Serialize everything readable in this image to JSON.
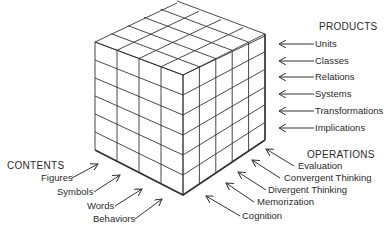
{
  "diagram": {
    "colors": {
      "line": "#333333",
      "text": "#2a2a2a",
      "background": "#ffffff"
    },
    "cube": {
      "front_face_columns": 4,
      "right_face_columns": 5,
      "rows": 6
    },
    "products": {
      "heading": "PRODUCTS",
      "items": [
        "Units",
        "Classes",
        "Relations",
        "Systems",
        "Transformations",
        "Implications"
      ]
    },
    "operations": {
      "heading": "OPERATIONS",
      "items": [
        "Evaluation",
        "Convergent Thinking",
        "Divergent Thinking",
        "Memorization",
        "Cognition"
      ]
    },
    "contents": {
      "heading": "CONTENTS",
      "items": [
        "Figures",
        "Symbols",
        "Words",
        "Behaviors"
      ]
    }
  }
}
